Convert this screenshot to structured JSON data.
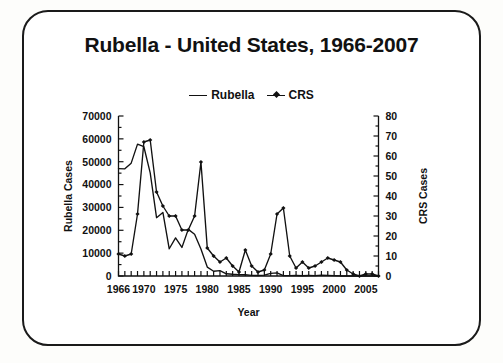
{
  "chart_data": {
    "type": "line",
    "title": "Rubella - United States, 1966-2007",
    "xlabel": "Year",
    "ylabel": "Rubella Cases",
    "y2label": "CRS Cases",
    "grid": false,
    "legend_position": "top-center",
    "xlim": [
      1966,
      2007
    ],
    "ylim": [
      0,
      70000
    ],
    "y2lim": [
      0,
      80
    ],
    "x": [
      1966,
      1967,
      1968,
      1969,
      1970,
      1971,
      1972,
      1973,
      1974,
      1975,
      1976,
      1977,
      1978,
      1979,
      1980,
      1981,
      1982,
      1983,
      1984,
      1985,
      1986,
      1987,
      1988,
      1989,
      1990,
      1991,
      1992,
      1993,
      1994,
      1995,
      1996,
      1997,
      1998,
      1999,
      2000,
      2001,
      2002,
      2003,
      2004,
      2005,
      2006,
      2007
    ],
    "xticks": [
      1966,
      1970,
      1975,
      1980,
      1985,
      1990,
      1995,
      2000,
      2005
    ],
    "xticklabels": [
      "1966",
      "1970",
      "1975",
      "1980",
      "1985",
      "1990",
      "1995",
      "2000",
      "2005"
    ],
    "yticks": [
      0,
      10000,
      20000,
      30000,
      40000,
      50000,
      60000,
      70000
    ],
    "yticklabels": [
      "0",
      "10000",
      "20000",
      "30000",
      "40000",
      "50000",
      "60000",
      "70000"
    ],
    "y2ticks": [
      0,
      10,
      20,
      30,
      40,
      50,
      60,
      70,
      80
    ],
    "y2ticklabels": [
      "0",
      "10",
      "20",
      "30",
      "40",
      "50",
      "60",
      "70",
      "80"
    ],
    "series": [
      {
        "name": "Rubella",
        "axis": "left",
        "marker": "none",
        "color": "#111111",
        "values": [
          46975,
          46888,
          49371,
          57686,
          56552,
          45086,
          25507,
          27804,
          11917,
          16652,
          12491,
          20395,
          18269,
          11795,
          3904,
          2077,
          2325,
          970,
          752,
          630,
          551,
          306,
          225,
          396,
          1125,
          1401,
          160,
          192,
          227,
          128,
          238,
          181,
          364,
          267,
          176,
          23,
          18,
          7,
          10,
          11,
          11,
          12
        ]
      },
      {
        "name": "CRS",
        "axis": "right",
        "marker": "diamond",
        "color": "#111111",
        "values": [
          11,
          10,
          11,
          31,
          67,
          68,
          42,
          35,
          30,
          30,
          23,
          23,
          30,
          57,
          14,
          10,
          7,
          9,
          5,
          2,
          13,
          5,
          2,
          3,
          11,
          31,
          34,
          10,
          4,
          7,
          4,
          5,
          7,
          9,
          8,
          7,
          3,
          1,
          0,
          1,
          1,
          0
        ]
      }
    ],
    "annotations": []
  },
  "legend": {
    "entries": [
      {
        "label": "Rubella",
        "marker": false
      },
      {
        "label": "CRS",
        "marker": true
      }
    ]
  },
  "axes": {
    "left_title": "Rubella Cases",
    "right_title": "CRS Cases",
    "x_title": "Year"
  },
  "title": "Rubella - United States, 1966-2007"
}
